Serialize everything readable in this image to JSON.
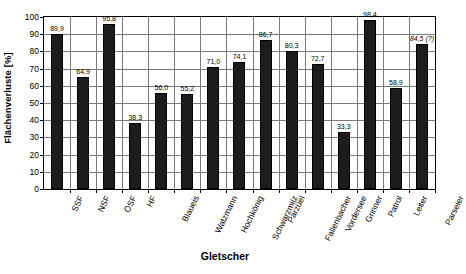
{
  "chart_data": {
    "type": "bar",
    "title": "",
    "xlabel": "Gletscher",
    "ylabel": "Flächenverluste [%]",
    "ylim": [
      0,
      100
    ],
    "ytick_values": [
      0,
      10,
      20,
      30,
      40,
      50,
      60,
      70,
      80,
      90,
      100
    ],
    "ytick_labels": [
      "0",
      "10",
      "20",
      "30",
      "40",
      "50",
      "60",
      "70",
      "80",
      "90",
      "100"
    ],
    "grid": "horizontal-and-vertical",
    "legend": "none",
    "bar_color": "#1c1c1c",
    "categories": [
      "SSF",
      "NSF",
      "ÖSF",
      "HF",
      "Blaueis",
      "Watzmann",
      "Hochkönig",
      "Schwarzmilz",
      "Parzüel",
      "Fallenbacher",
      "Vordersee",
      "Grinner",
      "Patrol",
      "Leiter",
      "Parseier"
    ],
    "values": [
      89.9,
      64.9,
      95.8,
      38.3,
      56.0,
      55.2,
      71.0,
      74.1,
      86.7,
      80.3,
      72.7,
      33.3,
      98.4,
      58.9,
      84.5
    ],
    "value_labels": [
      "89,9",
      "64,9",
      "95,8",
      "38,3",
      "56,0",
      "55,2",
      "71,0",
      "74,1",
      "86,7",
      "80,3",
      "72,7",
      "33,3",
      "98,4",
      "58,9",
      "84,5 (?)"
    ],
    "value_label_styles": [
      "normal",
      "normal",
      "normal",
      "normal",
      "normal",
      "normal",
      "normal",
      "normal",
      "normal",
      "normal",
      "normal",
      "normal",
      "normal",
      "normal",
      "italic"
    ]
  }
}
